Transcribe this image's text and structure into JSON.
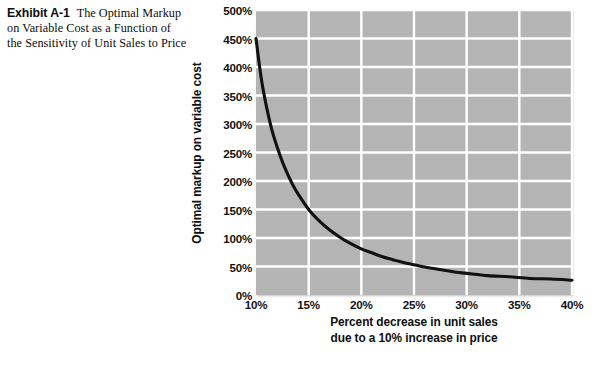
{
  "caption": {
    "exhibit_label": "Exhibit A-1",
    "text": "The Optimal Markup on Variable Cost as a Function of the Sensitivity of Unit Sales to Price"
  },
  "colors": {
    "plot_background": "#b7b7b7",
    "gridline": "#ffffff",
    "curve": "#111111",
    "text": "#111111",
    "page_background": "#ffffff"
  },
  "chart_data": {
    "type": "line",
    "title": "",
    "xlabel_line1": "Percent decrease in unit sales",
    "xlabel_line2": "due to a 10% increase in price",
    "ylabel": "Optimal markup on variable cost",
    "xlim": [
      10,
      40
    ],
    "ylim": [
      0,
      500
    ],
    "xtick_labels": [
      "10%",
      "15%",
      "20%",
      "25%",
      "30%",
      "35%",
      "40%"
    ],
    "xticks": [
      10,
      15,
      20,
      25,
      30,
      35,
      40
    ],
    "ytick_labels": [
      "0%",
      "50%",
      "100%",
      "150%",
      "200%",
      "250%",
      "300%",
      "350%",
      "400%",
      "450%",
      "500%"
    ],
    "yticks": [
      0,
      50,
      100,
      150,
      200,
      250,
      300,
      350,
      400,
      450,
      500
    ],
    "grid": true,
    "legend": "none",
    "series": [
      {
        "name": "Optimal markup on variable cost",
        "x": [
          10.0,
          10.5,
          11.0,
          11.5,
          12.0,
          12.5,
          13.0,
          13.5,
          14.0,
          15.0,
          16.0,
          17.0,
          18.0,
          19.0,
          20.0,
          21.0,
          22.0,
          23.0,
          24.0,
          25.0,
          26.0,
          27.0,
          28.0,
          29.0,
          30.0,
          32.0,
          34.0,
          36.0,
          38.0,
          40.0
        ],
        "values": [
          450,
          380,
          330,
          290,
          260,
          234,
          212,
          193,
          177,
          150,
          130,
          114,
          101,
          90,
          81,
          74,
          67,
          62,
          57,
          53,
          49,
          46,
          43,
          40,
          38,
          34,
          32,
          29,
          28,
          26
        ]
      }
    ]
  }
}
